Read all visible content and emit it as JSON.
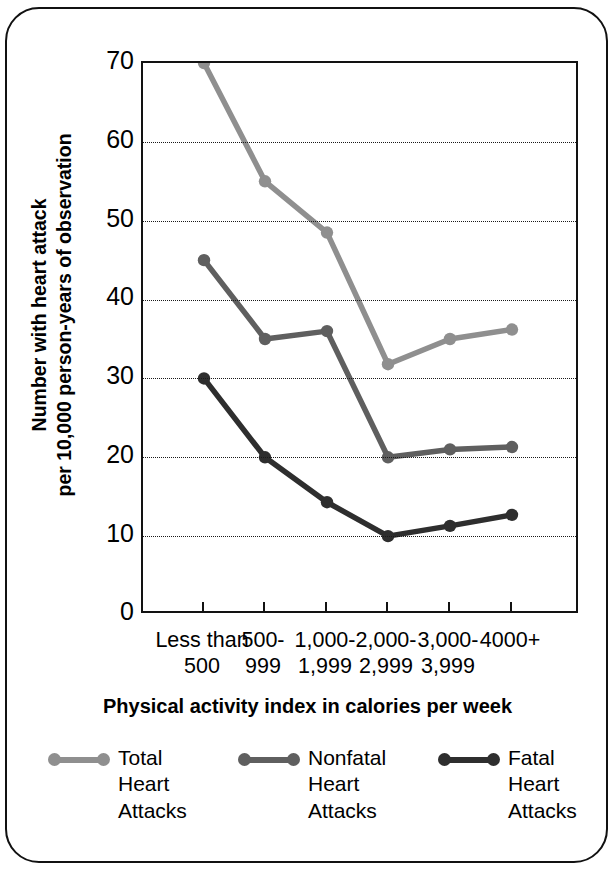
{
  "chart_data": {
    "type": "line",
    "title": "",
    "xlabel": "Physical activity index in calories per week",
    "ylabel": "Number with heart attack\nper 10,000 person-years of observation",
    "ylabel_line1": "Number with heart attack",
    "ylabel_line2": "per 10,000 person-years of observation",
    "categories": [
      "Less than\n500",
      "500-\n999",
      "1,000-\n1,999",
      "2,000-\n2,999",
      "3,000-\n3,999",
      "4000+"
    ],
    "ylim": [
      0,
      70
    ],
    "yticks": [
      0,
      10,
      20,
      30,
      40,
      50,
      60,
      70
    ],
    "ytick_labels": [
      "0",
      "10",
      "20",
      "30",
      "40",
      "50",
      "60",
      "70"
    ],
    "grid": true,
    "grid_style": "dotted-horizontal",
    "legend_position": "bottom",
    "series": [
      {
        "name": "Total\nHeart\nAttacks",
        "short_name": "Total Heart Attacks",
        "color": "#8f8f8f",
        "values": [
          70,
          55,
          48.5,
          31.8,
          35,
          36.2
        ]
      },
      {
        "name": "Nonfatal\nHeart\nAttacks",
        "short_name": "Nonfatal Heart Attacks",
        "color": "#5f5f5f",
        "values": [
          45,
          35,
          36,
          20,
          21,
          21.3
        ]
      },
      {
        "name": "Fatal\nHeart\nAttacks",
        "short_name": "Fatal Heart Attacks",
        "color": "#2e2e2e",
        "values": [
          30,
          20,
          14.3,
          10,
          11.3,
          12.7
        ]
      }
    ]
  },
  "colors": {
    "total": "#8f8f8f",
    "nonfatal": "#5f5f5f",
    "fatal": "#2e2e2e",
    "axis": "#121212",
    "background": "#ffffff"
  }
}
